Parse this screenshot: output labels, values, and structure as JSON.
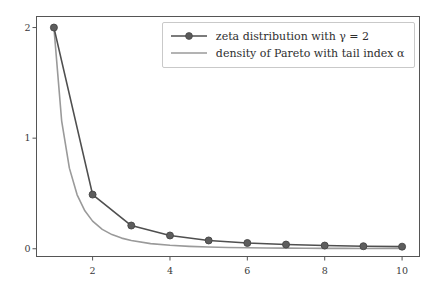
{
  "chart_data": {
    "type": "line",
    "title": "",
    "xlabel": "",
    "ylabel": "",
    "xlim": [
      0.55,
      10.45
    ],
    "ylim": [
      -0.07,
      2.1
    ],
    "grid": false,
    "legend_position": "upper right",
    "x": [
      1,
      2,
      3,
      4,
      5,
      6,
      7,
      8,
      9,
      10
    ],
    "xticks": [
      2,
      4,
      6,
      8,
      10
    ],
    "xtick_labels": [
      "2",
      "4",
      "6",
      "8",
      "10"
    ],
    "yticks": [
      0,
      1,
      2
    ],
    "ytick_labels": [
      "0",
      "1",
      "2"
    ],
    "series": [
      {
        "name": "zeta distribution with γ = 2",
        "marker": "circle",
        "color": "#4f4f4f",
        "values": [
          2.0,
          0.49,
          0.21,
          0.12,
          0.075,
          0.052,
          0.038,
          0.029,
          0.023,
          0.019
        ]
      },
      {
        "name": "density of Pareto with tail index α",
        "marker": "none",
        "color": "#9a9a9a",
        "x": [
          1.0,
          1.2,
          1.4,
          1.6,
          1.8,
          2.0,
          2.25,
          2.5,
          2.75,
          3.0,
          3.5,
          4.0,
          4.5,
          5.0,
          5.5,
          6.0,
          6.5,
          7.0,
          7.5,
          8.0,
          8.5,
          9.0,
          9.5,
          10.0
        ],
        "values": [
          2.0,
          1.157,
          0.729,
          0.488,
          0.343,
          0.25,
          0.1756,
          0.128,
          0.0962,
          0.0741,
          0.0466,
          0.03125,
          0.02195,
          0.016,
          0.012,
          0.00926,
          0.00728,
          0.00583,
          0.00474,
          0.00391,
          0.00326,
          0.00274,
          0.00233,
          0.002
        ]
      }
    ]
  },
  "legend": {
    "items": [
      {
        "label_plain": "zeta distribution with ",
        "symbol": "γ",
        "label_tail": " = 2"
      },
      {
        "label_plain": "density of Pareto with tail index ",
        "symbol": "α",
        "label_tail": ""
      }
    ]
  }
}
